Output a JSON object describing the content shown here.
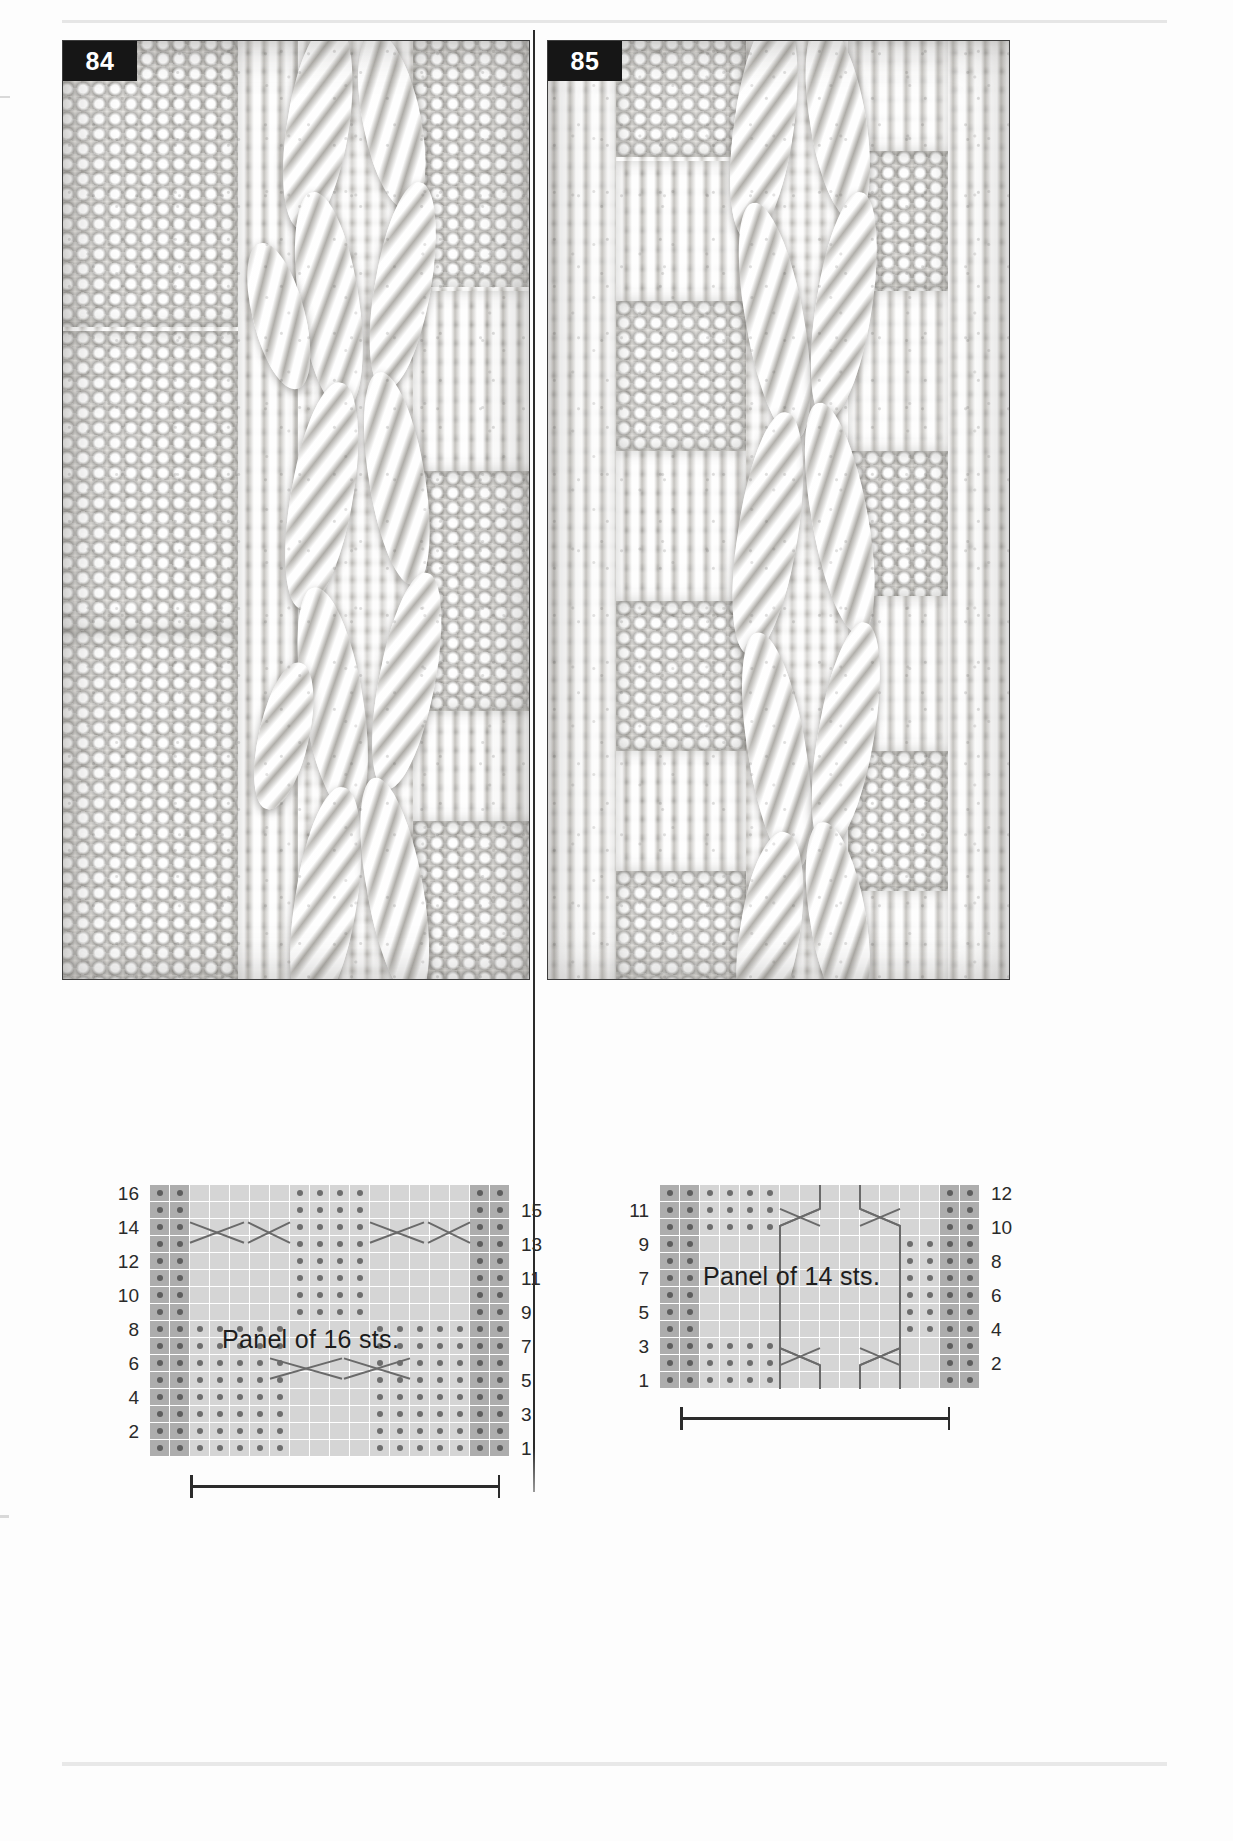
{
  "page": {
    "kind": "knitting-stitch-pattern-reference"
  },
  "patterns": [
    {
      "id": "84",
      "number_label": "84",
      "caption": "Panel of 16 sts.",
      "stitch_count": 16,
      "rows": 16,
      "row_numbers_left": [
        "16",
        "14",
        "12",
        "10",
        "8",
        "6",
        "4",
        "2"
      ],
      "row_numbers_right": [
        "15",
        "13",
        "11",
        "9",
        "7",
        "5",
        "3",
        "1"
      ],
      "chart_data": {
        "type": "table",
        "title": "Chart 84 — Panel of 16 sts.",
        "columns": 16,
        "rows": 16,
        "legend": [
          {
            "symbol": "purl-dot",
            "label": "purl on RS, knit on WS"
          },
          {
            "symbol": "blank",
            "label": "knit on RS, purl on WS"
          },
          {
            "symbol": "cable-cross",
            "label": "cable cross"
          }
        ],
        "grid": [
          "PP.....PPPP.....PP",
          "PP.....PPPP.....PP",
          "PP.....PPPP.....PP",
          "PP.....PPPP.....PP",
          "PP.....PPPP.....PP",
          "PP.....PPPP.....PP",
          "PP.....PPPP.....PP",
          "PP.....PPPP.....PP",
          "PPPPPPP....PPPPPPP",
          "PPPPPPP....PPPPPPP",
          "PPPPPPP....PPPPPPP",
          "PPPPPPP....PPPPPPP",
          "PPPPPPP....PPPPPPP",
          "PPPPPPP....PPPPPPP",
          "PPPPPPP....PPPPPPP",
          "PPPPPPP....PPPPPPP"
        ]
      }
    },
    {
      "id": "85",
      "number_label": "85",
      "caption": "Panel of 14 sts.",
      "stitch_count": 14,
      "rows": 12,
      "row_numbers_left": [
        "11",
        "9",
        "7",
        "5",
        "3",
        "1"
      ],
      "row_numbers_right": [
        "12",
        "10",
        "8",
        "6",
        "4",
        "2"
      ],
      "chart_data": {
        "type": "table",
        "title": "Chart 85 — Panel of 14 sts.",
        "columns": 14,
        "rows": 12,
        "legend": [
          {
            "symbol": "purl-dot",
            "label": "purl on RS, knit on WS"
          },
          {
            "symbol": "blank",
            "label": "knit on RS, purl on WS"
          },
          {
            "symbol": "travel-line",
            "label": "traveling cable stitch"
          }
        ],
        "grid": [
          "PP....KKKKKKPP",
          "PP....KKKKKKPP",
          "PP....KKKKKKPP",
          "PPKKKKKKKK..PP",
          "PPKKKKKKKK..PP",
          "PPKKKKKKKK..PP",
          "PPKKKKKKKK..PP",
          "PPKKKKKKKK..PP",
          "PPKKKKKKKK..PP",
          "PP....KKKKKKPP",
          "PP....KKKKKKPP",
          "PP....KKKKKKPP"
        ]
      }
    }
  ]
}
